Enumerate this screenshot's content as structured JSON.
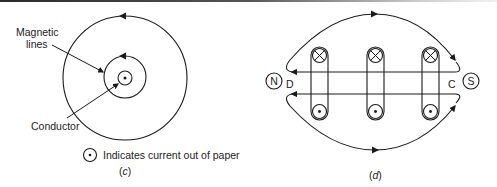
{
  "figure_c": {
    "label_magnetic_line1": "Magnetic",
    "label_magnetic_line2": "lines",
    "label_conductor": "Conductor",
    "legend_text": "Indicates current out of paper",
    "caption_open": "(",
    "caption_letter": "c",
    "caption_close": ")"
  },
  "figure_d": {
    "pole_left": "N",
    "pole_right": "S",
    "label_left": "D",
    "label_right": "C",
    "caption_open": "(",
    "caption_letter": "d",
    "caption_close": ")",
    "conductor_loops": [
      {
        "top": "cross (into paper)",
        "bottom": "dot (out of paper)"
      },
      {
        "top": "cross (into paper)",
        "bottom": "dot (out of paper)"
      },
      {
        "top": "cross (into paper)",
        "bottom": "dot (out of paper)"
      }
    ]
  },
  "colors": {
    "stroke": "#1a1a1a",
    "text": "#222222",
    "background": "#ffffff"
  }
}
